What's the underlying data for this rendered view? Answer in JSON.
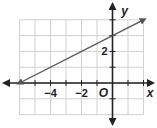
{
  "chart_data": {
    "type": "line",
    "title": "",
    "xlabel": "x",
    "ylabel": "y",
    "origin_label": "O",
    "xlim": [
      -6,
      2
    ],
    "ylim": [
      -2,
      4
    ],
    "grid": true,
    "x_tick_labels": [
      {
        "value": -4,
        "label": "−4"
      },
      {
        "value": -2,
        "label": "−2"
      }
    ],
    "y_tick_labels": [
      {
        "value": 2,
        "label": "2"
      }
    ],
    "series": [
      {
        "name": "line",
        "equation": "y = 0.5x + 3",
        "slope": 0.5,
        "intercept": 3,
        "x": [
          -6,
          2
        ],
        "y": [
          0,
          4
        ],
        "arrows": "both"
      }
    ],
    "colors": {
      "grid": "#d0d0d0",
      "axis": "#222222",
      "line": "#555555"
    }
  }
}
